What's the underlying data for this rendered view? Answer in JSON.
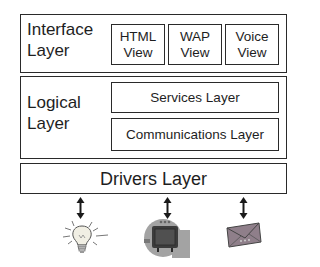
{
  "diagram": {
    "interface_layer": {
      "label": "Interface\nLayer",
      "views": [
        {
          "label": "HTML\nView"
        },
        {
          "label": "WAP\nView"
        },
        {
          "label": "Voice\nView"
        }
      ]
    },
    "logical_layer": {
      "label": "Logical\nLayer",
      "sublayers": [
        {
          "label": "Services Layer"
        },
        {
          "label": "Communications Layer"
        }
      ]
    },
    "drivers_layer": {
      "label": "Drivers Layer"
    },
    "devices": [
      {
        "icon": "lightbulb-icon"
      },
      {
        "icon": "television-icon"
      },
      {
        "icon": "envelope-icon"
      }
    ],
    "colors": {
      "border": "#2a2a2a",
      "text": "#1e1e1e",
      "tv_bg": "#9a9a9a",
      "tv_body": "#3a3a3a",
      "envelope": "#8a7a86"
    }
  }
}
